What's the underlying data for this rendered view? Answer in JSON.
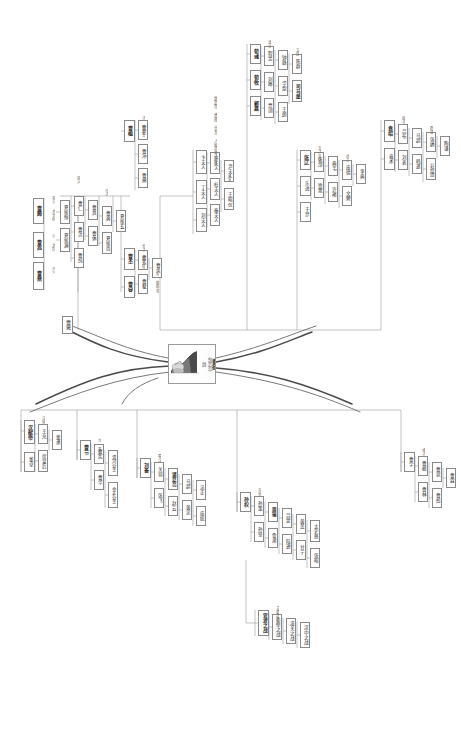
{
  "document": {
    "type": "mind-map",
    "orientation": "rotated-90-ccw",
    "language": "zh",
    "background_color": "#ffffff",
    "line_color": "#9a9a9a",
    "root_line_color": "#555555",
    "node_border_color": "#8a8a8a",
    "text_color": "#2b2b2b",
    "muted_text_color": "#6d6d6d"
  },
  "center": {
    "name": "central-portrait-node",
    "title": "曹操",
    "subtitle": "（魏武帝）",
    "caption": "魏",
    "portrait_alt": "portrait-illustration"
  },
  "branches": [
    {
      "id": "b1",
      "label": "父族",
      "side": "upper-left"
    },
    {
      "id": "b2",
      "label": "母族",
      "side": "upper-right"
    },
    {
      "id": "b3",
      "label": "妻族",
      "side": "lower-left"
    },
    {
      "id": "b4",
      "label": "子孙",
      "side": "lower-right"
    }
  ],
  "nodes": [
    {
      "id": "n001",
      "text": "曹腾",
      "x": 33,
      "y": 198,
      "w": 11,
      "h": 26,
      "bold": true,
      "fs": 5
    },
    {
      "id": "n002",
      "text": "曹嵩",
      "x": 33,
      "y": 232,
      "w": 11,
      "h": 26,
      "bold": true,
      "fs": 5
    },
    {
      "id": "n003",
      "text": "曹鼎",
      "x": 33,
      "y": 262,
      "w": 11,
      "h": 28,
      "bold": true,
      "fs": 5
    },
    {
      "id": "n004",
      "text": "曹褒",
      "x": 62,
      "y": 316,
      "w": 11,
      "h": 18,
      "bold": false,
      "fs": 5
    },
    {
      "id": "n005",
      "text": "夏侯惇",
      "x": 60,
      "y": 200,
      "w": 10,
      "h": 24,
      "bold": false,
      "fs": 4.6
    },
    {
      "id": "n006",
      "text": "夏侯渊",
      "x": 60,
      "y": 228,
      "w": 10,
      "h": 24,
      "bold": false,
      "fs": 4.6
    },
    {
      "id": "n007",
      "text": "曹仁",
      "x": 74,
      "y": 196,
      "w": 10,
      "h": 20,
      "bold": false,
      "fs": 4.6
    },
    {
      "id": "n008",
      "text": "曹洪",
      "x": 74,
      "y": 222,
      "w": 10,
      "h": 20,
      "bold": false,
      "fs": 4.6
    },
    {
      "id": "n009",
      "text": "曹纯",
      "x": 74,
      "y": 248,
      "w": 10,
      "h": 20,
      "bold": false,
      "fs": 4.6
    },
    {
      "id": "n010",
      "text": "曹真",
      "x": 88,
      "y": 200,
      "w": 10,
      "h": 20,
      "bold": false,
      "fs": 4.6
    },
    {
      "id": "n011",
      "text": "曹休",
      "x": 88,
      "y": 226,
      "w": 10,
      "h": 20,
      "bold": false,
      "fs": 4.6
    },
    {
      "id": "n012",
      "text": "曹爽",
      "x": 102,
      "y": 206,
      "w": 10,
      "h": 20,
      "bold": false,
      "fs": 4.6
    },
    {
      "id": "n013",
      "text": "夏侯尚",
      "x": 102,
      "y": 232,
      "w": 10,
      "h": 22,
      "bold": false,
      "fs": 4.6
    },
    {
      "id": "n014",
      "text": "夏侯玄",
      "x": 116,
      "y": 210,
      "w": 10,
      "h": 22,
      "bold": false,
      "fs": 4.6
    },
    {
      "id": "n101",
      "text": "曹丕",
      "x": 124,
      "y": 248,
      "w": 11,
      "h": 22,
      "bold": true,
      "fs": 5
    },
    {
      "id": "n102",
      "text": "曹睿",
      "x": 124,
      "y": 276,
      "w": 11,
      "h": 22,
      "bold": true,
      "fs": 5
    },
    {
      "id": "n103",
      "text": "曹芳",
      "x": 138,
      "y": 250,
      "w": 10,
      "h": 20,
      "bold": false,
      "fs": 4.6
    },
    {
      "id": "n104",
      "text": "曹髦",
      "x": 138,
      "y": 274,
      "w": 10,
      "h": 20,
      "bold": false,
      "fs": 4.6
    },
    {
      "id": "n105",
      "text": "曹奂",
      "x": 152,
      "y": 258,
      "w": 10,
      "h": 20,
      "bold": false,
      "fs": 4.6
    },
    {
      "id": "n106",
      "text": "曹植",
      "x": 124,
      "y": 120,
      "w": 11,
      "h": 22,
      "bold": true,
      "fs": 5
    },
    {
      "id": "n107",
      "text": "曹彰",
      "x": 138,
      "y": 120,
      "w": 10,
      "h": 20,
      "bold": false,
      "fs": 4.6
    },
    {
      "id": "n108",
      "text": "曹冲",
      "x": 138,
      "y": 144,
      "w": 10,
      "h": 20,
      "bold": false,
      "fs": 4.6
    },
    {
      "id": "n109",
      "text": "曹熊",
      "x": 138,
      "y": 168,
      "w": 10,
      "h": 20,
      "bold": false,
      "fs": 4.6
    },
    {
      "id": "n201",
      "text": "卞夫人",
      "x": 196,
      "y": 150,
      "w": 11,
      "h": 24,
      "bold": false,
      "fs": 4.6
    },
    {
      "id": "n202",
      "text": "丁夫人",
      "x": 196,
      "y": 180,
      "w": 11,
      "h": 24,
      "bold": false,
      "fs": 4.6
    },
    {
      "id": "n203",
      "text": "刘夫人",
      "x": 196,
      "y": 208,
      "w": 11,
      "h": 24,
      "bold": false,
      "fs": 4.6
    },
    {
      "id": "n204",
      "text": "环夫人",
      "x": 210,
      "y": 152,
      "w": 10,
      "h": 22,
      "bold": false,
      "fs": 4.6
    },
    {
      "id": "n205",
      "text": "杜夫人",
      "x": 210,
      "y": 178,
      "w": 10,
      "h": 22,
      "bold": false,
      "fs": 4.6
    },
    {
      "id": "n206",
      "text": "秦夫人",
      "x": 210,
      "y": 204,
      "w": 10,
      "h": 22,
      "bold": false,
      "fs": 4.6
    },
    {
      "id": "n207",
      "text": "尹夫人",
      "x": 224,
      "y": 160,
      "w": 10,
      "h": 22,
      "bold": false,
      "fs": 4.6
    },
    {
      "id": "n208",
      "text": "王昭仪",
      "x": 224,
      "y": 188,
      "w": 10,
      "h": 22,
      "bold": false,
      "fs": 4.6
    },
    {
      "id": "n301",
      "text": "荀彧",
      "x": 250,
      "y": 44,
      "w": 11,
      "h": 20,
      "bold": true,
      "fs": 5
    },
    {
      "id": "n302",
      "text": "荀攸",
      "x": 250,
      "y": 70,
      "w": 11,
      "h": 20,
      "bold": true,
      "fs": 5
    },
    {
      "id": "n303",
      "text": "郭嘉",
      "x": 250,
      "y": 96,
      "w": 11,
      "h": 20,
      "bold": true,
      "fs": 5
    },
    {
      "id": "n304",
      "text": "程昱",
      "x": 264,
      "y": 46,
      "w": 10,
      "h": 20,
      "bold": false,
      "fs": 4.6
    },
    {
      "id": "n305",
      "text": "刘晔",
      "x": 264,
      "y": 72,
      "w": 10,
      "h": 20,
      "bold": false,
      "fs": 4.6
    },
    {
      "id": "n306",
      "text": "贾诩",
      "x": 264,
      "y": 98,
      "w": 10,
      "h": 20,
      "bold": false,
      "fs": 4.6
    },
    {
      "id": "n307",
      "text": "钟繇",
      "x": 278,
      "y": 50,
      "w": 10,
      "h": 20,
      "bold": false,
      "fs": 4.6
    },
    {
      "id": "n308",
      "text": "华歆",
      "x": 278,
      "y": 76,
      "w": 10,
      "h": 20,
      "bold": false,
      "fs": 4.6
    },
    {
      "id": "n309",
      "text": "王朗",
      "x": 278,
      "y": 102,
      "w": 10,
      "h": 20,
      "bold": false,
      "fs": 4.6
    },
    {
      "id": "n310",
      "text": "陈群",
      "x": 292,
      "y": 54,
      "w": 10,
      "h": 20,
      "bold": false,
      "fs": 4.6
    },
    {
      "id": "n311",
      "text": "司马懿",
      "x": 292,
      "y": 80,
      "w": 10,
      "h": 22,
      "bold": true,
      "fs": 4.6
    },
    {
      "id": "n401",
      "text": "张辽",
      "x": 300,
      "y": 150,
      "w": 11,
      "h": 20,
      "bold": true,
      "fs": 5
    },
    {
      "id": "n402",
      "text": "乐进",
      "x": 300,
      "y": 176,
      "w": 11,
      "h": 20,
      "bold": false,
      "fs": 4.6
    },
    {
      "id": "n403",
      "text": "于禁",
      "x": 300,
      "y": 202,
      "w": 11,
      "h": 20,
      "bold": false,
      "fs": 4.6
    },
    {
      "id": "n404",
      "text": "张郃",
      "x": 314,
      "y": 152,
      "w": 10,
      "h": 20,
      "bold": false,
      "fs": 4.6
    },
    {
      "id": "n405",
      "text": "徐晃",
      "x": 314,
      "y": 178,
      "w": 10,
      "h": 20,
      "bold": false,
      "fs": 4.6
    },
    {
      "id": "n406",
      "text": "典韦",
      "x": 328,
      "y": 156,
      "w": 10,
      "h": 20,
      "bold": false,
      "fs": 4.6
    },
    {
      "id": "n407",
      "text": "许褚",
      "x": 328,
      "y": 182,
      "w": 10,
      "h": 20,
      "bold": false,
      "fs": 4.6
    },
    {
      "id": "n408",
      "text": "庞德",
      "x": 342,
      "y": 160,
      "w": 10,
      "h": 20,
      "bold": false,
      "fs": 4.6
    },
    {
      "id": "n409",
      "text": "文聘",
      "x": 342,
      "y": 186,
      "w": 10,
      "h": 20,
      "bold": false,
      "fs": 4.6
    },
    {
      "id": "n410",
      "text": "李典",
      "x": 356,
      "y": 164,
      "w": 10,
      "h": 20,
      "bold": false,
      "fs": 4.6
    },
    {
      "id": "n501",
      "text": "袁绍",
      "x": 384,
      "y": 120,
      "w": 11,
      "h": 22,
      "bold": true,
      "fs": 5
    },
    {
      "id": "n502",
      "text": "袁术",
      "x": 384,
      "y": 148,
      "w": 11,
      "h": 22,
      "bold": false,
      "fs": 4.6
    },
    {
      "id": "n503",
      "text": "吕布",
      "x": 398,
      "y": 124,
      "w": 10,
      "h": 20,
      "bold": false,
      "fs": 4.6
    },
    {
      "id": "n504",
      "text": "刘表",
      "x": 398,
      "y": 150,
      "w": 10,
      "h": 20,
      "bold": false,
      "fs": 4.6
    },
    {
      "id": "n505",
      "text": "马超",
      "x": 412,
      "y": 128,
      "w": 10,
      "h": 20,
      "bold": false,
      "fs": 4.6
    },
    {
      "id": "n506",
      "text": "韩遂",
      "x": 412,
      "y": 154,
      "w": 10,
      "h": 20,
      "bold": false,
      "fs": 4.6
    },
    {
      "id": "n507",
      "text": "张绣",
      "x": 426,
      "y": 132,
      "w": 10,
      "h": 20,
      "bold": false,
      "fs": 4.6
    },
    {
      "id": "n508",
      "text": "公孙瓒",
      "x": 426,
      "y": 158,
      "w": 10,
      "h": 22,
      "bold": false,
      "fs": 4.6
    },
    {
      "id": "n509",
      "text": "陶谦",
      "x": 440,
      "y": 136,
      "w": 10,
      "h": 20,
      "bold": false,
      "fs": 4.6
    },
    {
      "id": "n601",
      "text": "汉献帝",
      "x": 24,
      "y": 420,
      "w": 11,
      "h": 24,
      "bold": true,
      "fs": 5
    },
    {
      "id": "n602",
      "text": "董卓",
      "x": 24,
      "y": 452,
      "w": 11,
      "h": 20,
      "bold": false,
      "fs": 4.6
    },
    {
      "id": "n603",
      "text": "王允",
      "x": 38,
      "y": 424,
      "w": 10,
      "h": 20,
      "bold": false,
      "fs": 4.6
    },
    {
      "id": "n604",
      "text": "伏皇后",
      "x": 38,
      "y": 450,
      "w": 10,
      "h": 22,
      "bold": false,
      "fs": 4.6
    },
    {
      "id": "n605",
      "text": "董承",
      "x": 52,
      "y": 430,
      "w": 10,
      "h": 20,
      "bold": false,
      "fs": 4.6
    },
    {
      "id": "n701",
      "text": "曹节",
      "x": 80,
      "y": 440,
      "w": 11,
      "h": 20,
      "bold": true,
      "fs": 5
    },
    {
      "id": "n702",
      "text": "曹宪",
      "x": 94,
      "y": 444,
      "w": 10,
      "h": 20,
      "bold": false,
      "fs": 4.6
    },
    {
      "id": "n703",
      "text": "曹华",
      "x": 94,
      "y": 470,
      "w": 10,
      "h": 20,
      "bold": false,
      "fs": 4.6
    },
    {
      "id": "n704",
      "text": "清河公主",
      "x": 108,
      "y": 450,
      "w": 10,
      "h": 26,
      "bold": false,
      "fs": 4.4
    },
    {
      "id": "n705",
      "text": "金乡公主",
      "x": 108,
      "y": 482,
      "w": 10,
      "h": 26,
      "bold": false,
      "fs": 4.4
    },
    {
      "id": "n801",
      "text": "刘备",
      "x": 140,
      "y": 458,
      "w": 11,
      "h": 20,
      "bold": true,
      "fs": 5
    },
    {
      "id": "n802",
      "text": "关羽",
      "x": 154,
      "y": 462,
      "w": 10,
      "h": 20,
      "bold": false,
      "fs": 4.6
    },
    {
      "id": "n803",
      "text": "张飞",
      "x": 154,
      "y": 488,
      "w": 10,
      "h": 20,
      "bold": false,
      "fs": 4.6
    },
    {
      "id": "n804",
      "text": "诸葛亮",
      "x": 168,
      "y": 468,
      "w": 10,
      "h": 22,
      "bold": true,
      "fs": 4.6
    },
    {
      "id": "n805",
      "text": "赵云",
      "x": 168,
      "y": 496,
      "w": 10,
      "h": 20,
      "bold": false,
      "fs": 4.6
    },
    {
      "id": "n806",
      "text": "马超",
      "x": 182,
      "y": 474,
      "w": 10,
      "h": 20,
      "bold": false,
      "fs": 4.6
    },
    {
      "id": "n807",
      "text": "黄忠",
      "x": 182,
      "y": 500,
      "w": 10,
      "h": 20,
      "bold": false,
      "fs": 4.6
    },
    {
      "id": "n808",
      "text": "法正",
      "x": 196,
      "y": 480,
      "w": 10,
      "h": 20,
      "bold": false,
      "fs": 4.6
    },
    {
      "id": "n809",
      "text": "庞统",
      "x": 196,
      "y": 506,
      "w": 10,
      "h": 20,
      "bold": false,
      "fs": 4.6
    },
    {
      "id": "n901",
      "text": "孙权",
      "x": 240,
      "y": 492,
      "w": 11,
      "h": 20,
      "bold": true,
      "fs": 5
    },
    {
      "id": "n902",
      "text": "孙策",
      "x": 254,
      "y": 496,
      "w": 10,
      "h": 20,
      "bold": false,
      "fs": 4.6
    },
    {
      "id": "n903",
      "text": "孙坚",
      "x": 254,
      "y": 522,
      "w": 10,
      "h": 20,
      "bold": false,
      "fs": 4.6
    },
    {
      "id": "n904",
      "text": "周瑜",
      "x": 268,
      "y": 502,
      "w": 10,
      "h": 20,
      "bold": true,
      "fs": 4.6
    },
    {
      "id": "n905",
      "text": "鲁肃",
      "x": 268,
      "y": 528,
      "w": 10,
      "h": 20,
      "bold": false,
      "fs": 4.6
    },
    {
      "id": "n906",
      "text": "吕蒙",
      "x": 282,
      "y": 508,
      "w": 10,
      "h": 20,
      "bold": false,
      "fs": 4.6
    },
    {
      "id": "n907",
      "text": "陆逊",
      "x": 282,
      "y": 534,
      "w": 10,
      "h": 20,
      "bold": false,
      "fs": 4.6
    },
    {
      "id": "n908",
      "text": "黄盖",
      "x": 296,
      "y": 514,
      "w": 10,
      "h": 20,
      "bold": false,
      "fs": 4.6
    },
    {
      "id": "n909",
      "text": "甘宁",
      "x": 296,
      "y": 540,
      "w": 10,
      "h": 20,
      "bold": false,
      "fs": 4.6
    },
    {
      "id": "n910",
      "text": "太史慈",
      "x": 310,
      "y": 520,
      "w": 10,
      "h": 22,
      "bold": false,
      "fs": 4.6
    },
    {
      "id": "n911",
      "text": "张昭",
      "x": 310,
      "y": 548,
      "w": 10,
      "h": 20,
      "bold": false,
      "fs": 4.6
    },
    {
      "id": "n1001",
      "text": "官渡之战",
      "x": 258,
      "y": 610,
      "w": 11,
      "h": 26,
      "bold": true,
      "fs": 4.8
    },
    {
      "id": "n1002",
      "text": "赤壁之战",
      "x": 272,
      "y": 614,
      "w": 10,
      "h": 26,
      "bold": false,
      "fs": 4.6
    },
    {
      "id": "n1003",
      "text": "潼关之战",
      "x": 286,
      "y": 618,
      "w": 10,
      "h": 26,
      "bold": false,
      "fs": 4.6
    },
    {
      "id": "n1004",
      "text": "汉中之战",
      "x": 300,
      "y": 622,
      "w": 10,
      "h": 26,
      "bold": false,
      "fs": 4.6
    },
    {
      "id": "n1101",
      "text": "曹宇",
      "x": 404,
      "y": 452,
      "w": 11,
      "h": 20,
      "bold": false,
      "fs": 4.6
    },
    {
      "id": "n1102",
      "text": "曹据",
      "x": 418,
      "y": 456,
      "w": 10,
      "h": 20,
      "bold": false,
      "fs": 4.6
    },
    {
      "id": "n1103",
      "text": "曹林",
      "x": 418,
      "y": 482,
      "w": 10,
      "h": 20,
      "bold": false,
      "fs": 4.6
    },
    {
      "id": "n1104",
      "text": "曹衮",
      "x": 432,
      "y": 462,
      "w": 10,
      "h": 20,
      "bold": false,
      "fs": 4.6
    },
    {
      "id": "n1105",
      "text": "曹彪",
      "x": 432,
      "y": 488,
      "w": 10,
      "h": 20,
      "bold": false,
      "fs": 4.6
    },
    {
      "id": "n1106",
      "text": "曹霖",
      "x": 446,
      "y": 468,
      "w": 10,
      "h": 20,
      "bold": false,
      "fs": 4.6
    }
  ],
  "labels": [
    {
      "id": "l01",
      "text": "祖父 大长秋",
      "x": 47,
      "y": 196,
      "w": 8,
      "h": 30,
      "fs": 4,
      "bold": false
    },
    {
      "id": "l02",
      "text": "父 太尉",
      "x": 47,
      "y": 234,
      "w": 8,
      "h": 22,
      "fs": 4,
      "bold": false
    },
    {
      "id": "l03",
      "text": "从父",
      "x": 47,
      "y": 266,
      "w": 8,
      "h": 16,
      "fs": 4,
      "bold": false
    },
    {
      "id": "l04",
      "text": "族人",
      "x": 72,
      "y": 176,
      "w": 8,
      "h": 16,
      "fs": 4,
      "bold": false
    },
    {
      "id": "l05",
      "text": "从子",
      "x": 100,
      "y": 188,
      "w": 8,
      "h": 16,
      "fs": 4,
      "bold": false
    },
    {
      "id": "l06",
      "text": "长子 魏文帝",
      "x": 137,
      "y": 244,
      "w": 8,
      "h": 30,
      "fs": 4,
      "bold": false
    },
    {
      "id": "l07",
      "text": "孙 魏明帝",
      "x": 151,
      "y": 272,
      "w": 8,
      "h": 26,
      "fs": 4,
      "bold": false
    },
    {
      "id": "l08",
      "text": "子 陈思王",
      "x": 137,
      "y": 116,
      "w": 8,
      "h": 26,
      "fs": 4,
      "bold": false
    },
    {
      "id": "l09",
      "text": "正室",
      "x": 209,
      "y": 146,
      "w": 8,
      "h": 16,
      "fs": 4,
      "bold": false
    },
    {
      "id": "l10",
      "text": "妾室",
      "x": 223,
      "y": 174,
      "w": 8,
      "h": 16,
      "fs": 4,
      "bold": false
    },
    {
      "id": "l11",
      "text": "谋士",
      "x": 263,
      "y": 40,
      "w": 8,
      "h": 16,
      "fs": 4,
      "bold": false
    },
    {
      "id": "l12",
      "text": "文臣",
      "x": 291,
      "y": 48,
      "w": 8,
      "h": 16,
      "fs": 4,
      "bold": false
    },
    {
      "id": "l13",
      "text": "五子良将",
      "x": 313,
      "y": 146,
      "w": 8,
      "h": 24,
      "fs": 4,
      "bold": false
    },
    {
      "id": "l14",
      "text": "虎卫",
      "x": 341,
      "y": 154,
      "w": 8,
      "h": 16,
      "fs": 4,
      "bold": false
    },
    {
      "id": "l15",
      "text": "敌手",
      "x": 397,
      "y": 116,
      "w": 8,
      "h": 16,
      "fs": 4,
      "bold": false
    },
    {
      "id": "l16",
      "text": "群雄",
      "x": 425,
      "y": 126,
      "w": 8,
      "h": 16,
      "fs": 4,
      "bold": false
    },
    {
      "id": "l17",
      "text": "汉室",
      "x": 37,
      "y": 416,
      "w": 8,
      "h": 16,
      "fs": 4,
      "bold": false
    },
    {
      "id": "l18",
      "text": "女 皇后",
      "x": 93,
      "y": 438,
      "w": 8,
      "h": 22,
      "fs": 4,
      "bold": false
    },
    {
      "id": "l19",
      "text": "蜀汉",
      "x": 153,
      "y": 454,
      "w": 8,
      "h": 16,
      "fs": 4,
      "bold": false
    },
    {
      "id": "l20",
      "text": "东吴",
      "x": 253,
      "y": 488,
      "w": 8,
      "h": 16,
      "fs": 4,
      "bold": false
    },
    {
      "id": "l21",
      "text": "主要战役",
      "x": 271,
      "y": 606,
      "w": 8,
      "h": 24,
      "fs": 4,
      "bold": false
    },
    {
      "id": "l22",
      "text": "诸子",
      "x": 417,
      "y": 448,
      "w": 8,
      "h": 16,
      "fs": 4,
      "bold": false
    },
    {
      "id": "l23",
      "text": "魏武帝 曹操 世系 人物 关系图",
      "x": 208,
      "y": 96,
      "w": 9,
      "h": 84,
      "fs": 4.4,
      "bold": false
    }
  ]
}
